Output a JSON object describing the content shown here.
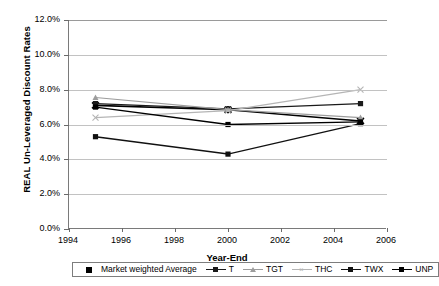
{
  "chart_data": {
    "type": "line",
    "title": "",
    "xlabel": "Year-End",
    "ylabel": "REAL Un-Leveraged Discount Rates",
    "x": [
      1995,
      2000,
      2005
    ],
    "xlim": [
      1994,
      2006
    ],
    "ylim": [
      0.0,
      12.0
    ],
    "xticks": [
      "1994",
      "1996",
      "1998",
      "2000",
      "2002",
      "2004",
      "2006"
    ],
    "xtick_values": [
      1994,
      1996,
      1998,
      2000,
      2002,
      2004,
      2006
    ],
    "yticks": [
      "0.0%",
      "2.0%",
      "4.0%",
      "6.0%",
      "8.0%",
      "10.0%",
      "12.0%"
    ],
    "ytick_values": [
      0.0,
      2.0,
      4.0,
      6.0,
      8.0,
      10.0,
      12.0
    ],
    "grid": "horizontal",
    "legend_position": "bottom",
    "series": [
      {
        "name": "Market weighted Average",
        "values": [
          7.1,
          6.85,
          6.2
        ],
        "color": "#000000",
        "marker": "star",
        "width": 1.6
      },
      {
        "name": "T",
        "values": [
          7.2,
          6.9,
          7.2
        ],
        "color": "#1a1a1a",
        "marker": "square",
        "width": 1.3
      },
      {
        "name": "TGT",
        "values": [
          7.55,
          6.85,
          6.4
        ],
        "color": "#9d9d9d",
        "marker": "tri",
        "width": 1.2
      },
      {
        "name": "THC",
        "values": [
          6.4,
          6.8,
          8.0
        ],
        "color": "#b5b5b5",
        "marker": "cross",
        "width": 1.2
      },
      {
        "name": "TWX",
        "values": [
          5.3,
          4.3,
          6.05
        ],
        "color": "#111111",
        "marker": "square",
        "width": 1.5
      },
      {
        "name": "UNP",
        "values": [
          7.0,
          6.0,
          6.15
        ],
        "color": "#000000",
        "marker": "square",
        "width": 1.4
      }
    ]
  },
  "legend": {
    "items": [
      {
        "label": "Market weighted Average"
      },
      {
        "label": "T"
      },
      {
        "label": "TGT"
      },
      {
        "label": "THC"
      },
      {
        "label": "TWX"
      },
      {
        "label": "UNP"
      }
    ]
  }
}
